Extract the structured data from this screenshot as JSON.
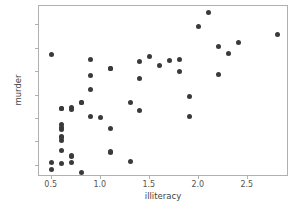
{
  "chart_data": {
    "type": "scatter",
    "title": "",
    "xlabel": "illiteracy",
    "ylabel": "murder",
    "xlim": [
      0.37,
      2.92
    ],
    "ylim": [
      1.05,
      15.65
    ],
    "xticks": [
      0.5,
      1.0,
      1.5,
      2.0,
      2.5
    ],
    "xticklabels": [
      "0.5",
      "1.0",
      "1.5",
      "2.0",
      "2.5"
    ],
    "yticks": [
      2,
      4,
      6,
      8,
      10,
      12,
      14
    ],
    "yticklabels": [
      "2",
      "4",
      "6",
      "8",
      "10",
      "12",
      "14"
    ],
    "grid": false,
    "legend": false,
    "marker": "circle",
    "marker_color": "#3a3a3a",
    "marker_size": 5,
    "series": [
      {
        "name": "states",
        "x": [
          2.1,
          1.5,
          1.8,
          1.9,
          1.1,
          0.7,
          1.1,
          0.9,
          1.3,
          2.0,
          1.9,
          0.6,
          0.9,
          0.7,
          0.5,
          0.6,
          1.6,
          2.8,
          0.7,
          0.9,
          1.1,
          0.9,
          0.6,
          2.4,
          0.8,
          0.6,
          0.6,
          0.5,
          0.7,
          1.1,
          2.2,
          1.4,
          1.8,
          0.8,
          0.8,
          1.1,
          0.6,
          1.0,
          1.3,
          2.3,
          0.5,
          1.7,
          2.2,
          0.6,
          0.6,
          1.4,
          0.6,
          1.4,
          0.7,
          0.6
        ],
        "y": [
          15.1,
          11.3,
          10.1,
          7.9,
          10.3,
          6.8,
          3.1,
          11.1,
          7.4,
          13.9,
          6.2,
          5.5,
          9.7,
          2.3,
          2.3,
          4.5,
          10.6,
          13.2,
          2.8,
          8.5,
          5.2,
          6.2,
          3.3,
          12.5,
          7.4,
          4.2,
          2.2,
          11.5,
          2.9,
          3.2,
          12.2,
          9.5,
          11.1,
          1.4,
          7.4,
          10.3,
          5.3,
          6.1,
          2.4,
          11.6,
          1.7,
          11.0,
          9.8,
          5.1,
          4.4,
          6.7,
          6.9,
          10.9,
          7.0,
          6.9
        ]
      }
    ]
  },
  "axis_titles": {
    "x": "illiteracy",
    "y": "murder"
  }
}
